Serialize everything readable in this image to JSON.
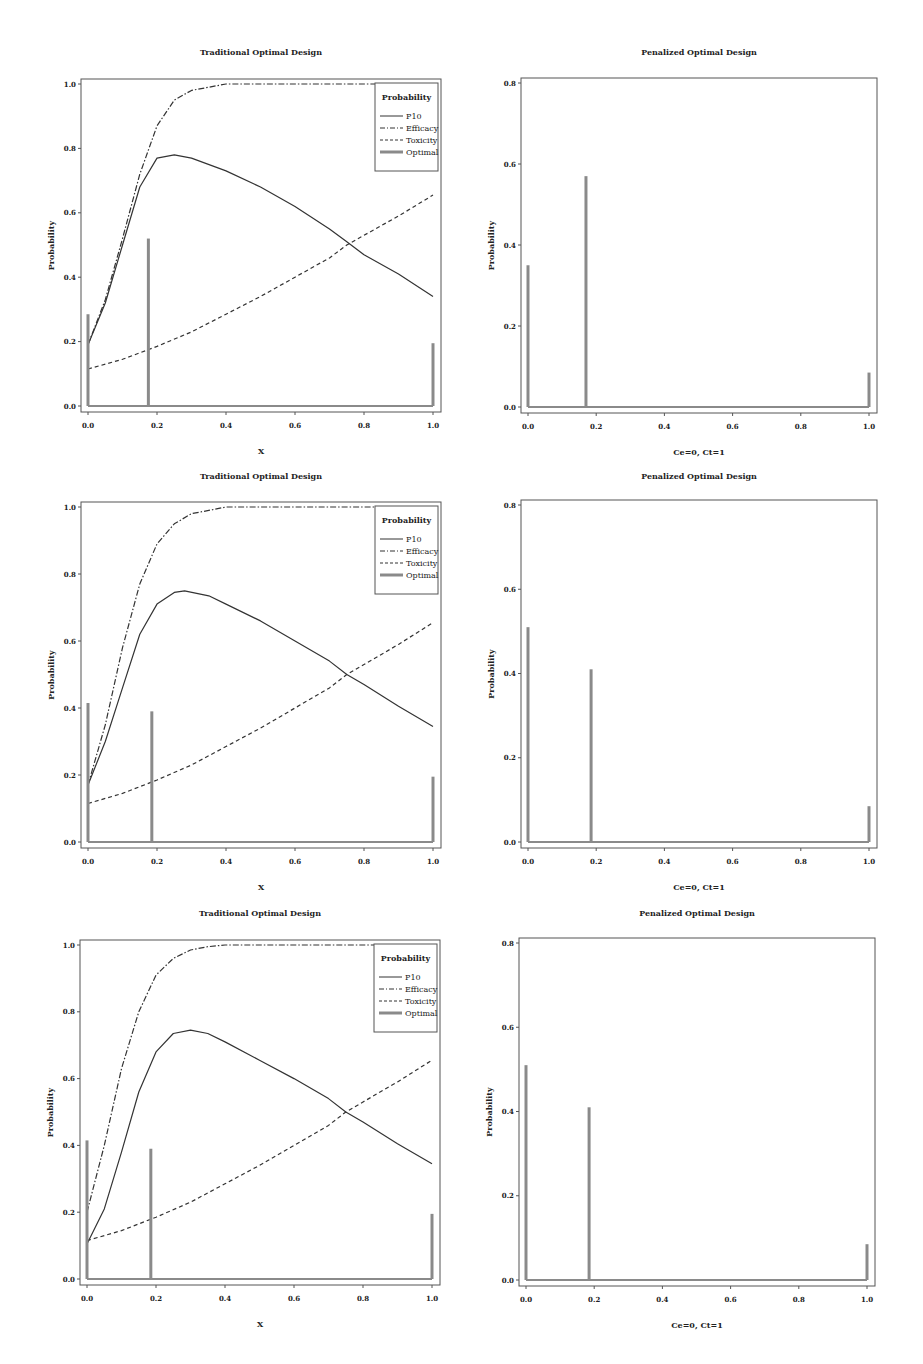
{
  "chart_data": [
    {
      "type": "line",
      "title": "Traditional Optimal Design",
      "xlabel": "X",
      "ylabel": "Probability",
      "xlim": [
        0,
        1
      ],
      "ylim": [
        0,
        1
      ],
      "xticks": [
        "0.0",
        "0.2",
        "0.4",
        "0.6",
        "0.8",
        "1.0"
      ],
      "yticks": [
        "0.0",
        "0.2",
        "0.4",
        "0.6",
        "0.8",
        "1.0"
      ],
      "legend": {
        "title": "Probability",
        "position": "top-right",
        "entries": [
          "P10",
          "Efficacy",
          "Toxicity",
          "Optimal"
        ]
      },
      "series": [
        {
          "name": "P10",
          "style": "solid",
          "x": [
            0,
            0.05,
            0.1,
            0.15,
            0.2,
            0.25,
            0.3,
            0.4,
            0.5,
            0.6,
            0.7,
            0.75,
            0.8,
            0.9,
            1.0
          ],
          "y": [
            0.19,
            0.32,
            0.5,
            0.68,
            0.77,
            0.78,
            0.77,
            0.73,
            0.68,
            0.62,
            0.55,
            0.51,
            0.47,
            0.41,
            0.34
          ]
        },
        {
          "name": "Efficacy",
          "style": "dashdot",
          "x": [
            0,
            0.05,
            0.1,
            0.15,
            0.2,
            0.25,
            0.3,
            0.35,
            0.4,
            0.5,
            0.6,
            0.8,
            1.0
          ],
          "y": [
            0.19,
            0.33,
            0.52,
            0.72,
            0.87,
            0.95,
            0.98,
            0.99,
            1.0,
            1.0,
            1.0,
            1.0,
            1.0
          ]
        },
        {
          "name": "Toxicity",
          "style": "dashed",
          "x": [
            0,
            0.1,
            0.2,
            0.3,
            0.4,
            0.5,
            0.6,
            0.7,
            0.75,
            0.8,
            0.9,
            1.0
          ],
          "y": [
            0.115,
            0.145,
            0.185,
            0.23,
            0.285,
            0.34,
            0.4,
            0.46,
            0.5,
            0.53,
            0.59,
            0.655
          ]
        },
        {
          "name": "Optimal",
          "style": "bar",
          "x": [
            0,
            0.175,
            1.0
          ],
          "y": [
            0.285,
            0.52,
            0.195
          ]
        }
      ]
    },
    {
      "type": "bar",
      "title": "Penalized Optimal Design",
      "xlabel": "Ce=0, Ct=1",
      "ylabel": "Probability",
      "xlim": [
        0,
        1
      ],
      "ylim": [
        0,
        0.8
      ],
      "xticks": [
        "0.0",
        "0.2",
        "0.4",
        "0.6",
        "0.8",
        "1.0"
      ],
      "yticks": [
        "0.0",
        "0.2",
        "0.4",
        "0.6",
        "0.8"
      ],
      "series": [
        {
          "name": "Optimal",
          "style": "bar",
          "x": [
            0,
            0.17,
            1.0
          ],
          "y": [
            0.35,
            0.57,
            0.085
          ]
        }
      ]
    },
    {
      "type": "line",
      "title": "Traditional Optimal Design",
      "xlabel": "X",
      "ylabel": "Probability",
      "xlim": [
        0,
        1
      ],
      "ylim": [
        0,
        1
      ],
      "xticks": [
        "0.0",
        "0.2",
        "0.4",
        "0.6",
        "0.8",
        "1.0"
      ],
      "yticks": [
        "0.0",
        "0.2",
        "0.4",
        "0.6",
        "0.8",
        "1.0"
      ],
      "legend": {
        "title": "Probability",
        "position": "top-right",
        "entries": [
          "P10",
          "Efficacy",
          "Toxicity",
          "Optimal"
        ]
      },
      "series": [
        {
          "name": "P10",
          "style": "solid",
          "x": [
            0,
            0.05,
            0.1,
            0.15,
            0.2,
            0.25,
            0.28,
            0.35,
            0.4,
            0.5,
            0.6,
            0.7,
            0.75,
            0.8,
            0.9,
            1.0
          ],
          "y": [
            0.17,
            0.3,
            0.46,
            0.62,
            0.71,
            0.745,
            0.75,
            0.735,
            0.71,
            0.66,
            0.6,
            0.54,
            0.5,
            0.47,
            0.405,
            0.345
          ]
        },
        {
          "name": "Efficacy",
          "style": "dashdot",
          "x": [
            0,
            0.05,
            0.1,
            0.15,
            0.2,
            0.25,
            0.3,
            0.35,
            0.4,
            0.5,
            0.6,
            0.8,
            1.0
          ],
          "y": [
            0.17,
            0.35,
            0.58,
            0.77,
            0.89,
            0.95,
            0.98,
            0.99,
            1.0,
            1.0,
            1.0,
            1.0,
            1.0
          ]
        },
        {
          "name": "Toxicity",
          "style": "dashed",
          "x": [
            0,
            0.1,
            0.2,
            0.3,
            0.4,
            0.5,
            0.6,
            0.7,
            0.75,
            0.8,
            0.9,
            1.0
          ],
          "y": [
            0.115,
            0.145,
            0.185,
            0.23,
            0.285,
            0.34,
            0.4,
            0.46,
            0.5,
            0.53,
            0.59,
            0.655
          ]
        },
        {
          "name": "Optimal",
          "style": "bar",
          "x": [
            0,
            0.185,
            1.0
          ],
          "y": [
            0.415,
            0.39,
            0.195
          ]
        }
      ]
    },
    {
      "type": "bar",
      "title": "Penalized Optimal Design",
      "xlabel": "Ce=0, Ct=1",
      "ylabel": "Probability",
      "xlim": [
        0,
        1
      ],
      "ylim": [
        0,
        0.8
      ],
      "xticks": [
        "0.0",
        "0.2",
        "0.4",
        "0.6",
        "0.8",
        "1.0"
      ],
      "yticks": [
        "0.0",
        "0.2",
        "0.4",
        "0.6",
        "0.8"
      ],
      "series": [
        {
          "name": "Optimal",
          "style": "bar",
          "x": [
            0,
            0.185,
            1.0
          ],
          "y": [
            0.51,
            0.41,
            0.085
          ]
        }
      ]
    },
    {
      "type": "line",
      "title": "Traditional Optimal Design",
      "xlabel": "X",
      "ylabel": "Probability",
      "xlim": [
        0,
        1
      ],
      "ylim": [
        0,
        1
      ],
      "xticks": [
        "0.0",
        "0.2",
        "0.4",
        "0.6",
        "0.8",
        "1.0"
      ],
      "yticks": [
        "0.0",
        "0.2",
        "0.4",
        "0.6",
        "0.8",
        "1.0"
      ],
      "legend": {
        "title": "Probability",
        "position": "top-right",
        "entries": [
          "P10",
          "Efficacy",
          "Toxicity",
          "Optimal"
        ]
      },
      "series": [
        {
          "name": "P10",
          "style": "solid",
          "x": [
            0,
            0.05,
            0.1,
            0.15,
            0.2,
            0.25,
            0.3,
            0.35,
            0.4,
            0.5,
            0.6,
            0.7,
            0.75,
            0.8,
            0.9,
            1.0
          ],
          "y": [
            0.105,
            0.21,
            0.38,
            0.56,
            0.68,
            0.735,
            0.745,
            0.735,
            0.71,
            0.655,
            0.6,
            0.54,
            0.5,
            0.47,
            0.405,
            0.345
          ]
        },
        {
          "name": "Efficacy",
          "style": "dashdot",
          "x": [
            0,
            0.05,
            0.1,
            0.15,
            0.2,
            0.25,
            0.3,
            0.35,
            0.4,
            0.5,
            0.6,
            0.8,
            1.0
          ],
          "y": [
            0.2,
            0.4,
            0.63,
            0.8,
            0.91,
            0.96,
            0.985,
            0.995,
            1.0,
            1.0,
            1.0,
            1.0,
            1.0
          ]
        },
        {
          "name": "Toxicity",
          "style": "dashed",
          "x": [
            0,
            0.1,
            0.2,
            0.3,
            0.4,
            0.5,
            0.6,
            0.7,
            0.75,
            0.8,
            0.9,
            1.0
          ],
          "y": [
            0.115,
            0.145,
            0.185,
            0.23,
            0.285,
            0.34,
            0.4,
            0.46,
            0.5,
            0.53,
            0.59,
            0.655
          ]
        },
        {
          "name": "Optimal",
          "style": "bar",
          "x": [
            0,
            0.185,
            1.0
          ],
          "y": [
            0.415,
            0.39,
            0.195
          ]
        }
      ]
    },
    {
      "type": "bar",
      "title": "Penalized Optimal Design",
      "xlabel": "Ce=0, Ct=1",
      "ylabel": "Probability",
      "xlim": [
        0,
        1
      ],
      "ylim": [
        0,
        0.8
      ],
      "xticks": [
        "0.0",
        "0.2",
        "0.4",
        "0.6",
        "0.8",
        "1.0"
      ],
      "yticks": [
        "0.0",
        "0.2",
        "0.4",
        "0.6",
        "0.8"
      ],
      "series": [
        {
          "name": "Optimal",
          "style": "bar",
          "x": [
            0,
            0.185,
            1.0
          ],
          "y": [
            0.51,
            0.41,
            0.085
          ]
        }
      ]
    }
  ],
  "colors": {
    "line": "#333333",
    "bar": "#8a8a8a",
    "frame": "#555555",
    "background": "#ffffff"
  }
}
